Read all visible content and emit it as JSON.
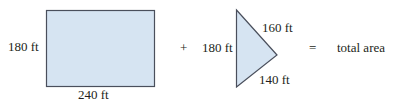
{
  "diagram": {
    "rectangle": {
      "height_label": "180 ft",
      "width_label": "240 ft",
      "fill": "#d6e4f2",
      "stroke": "#4a4f5c"
    },
    "plus_sign": "+",
    "triangle": {
      "left_label": "180 ft",
      "upper_right_label": "160 ft",
      "lower_right_label": "140 ft",
      "fill": "#d6e4f2",
      "stroke": "#4a4f5c"
    },
    "equals_sign": "=",
    "result_label": "total area"
  }
}
